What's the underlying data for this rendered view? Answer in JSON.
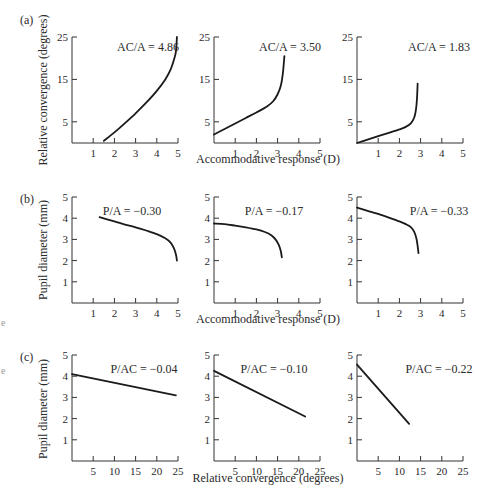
{
  "figure": {
    "rows": [
      {
        "panel_label": "(a)",
        "ylabel": "Relative convergence (degrees)",
        "xlabel": "Accommodative response (D)"
      },
      {
        "panel_label": "(b)",
        "ylabel": "Pupil diameter (mm)",
        "xlabel": "Accommodative response (D)"
      },
      {
        "panel_label": "(c)",
        "ylabel": "Pupil diameter (mm)",
        "xlabel": "Relative convergence (degrees)"
      }
    ],
    "stray_marks": [
      "e",
      "e"
    ]
  },
  "chart_data": [
    {
      "type": "line",
      "row": "a",
      "col": 1,
      "annotation": "AC/A = 4.86",
      "xlabel": "",
      "ylabel": "Relative convergence (degrees)",
      "xlim": [
        0,
        5
      ],
      "ylim": [
        0,
        25
      ],
      "xticks": [
        1,
        2,
        3,
        4,
        5
      ],
      "yticks": [
        5,
        15,
        25
      ],
      "x": [
        1.5,
        2.0,
        2.5,
        3.0,
        3.5,
        4.0,
        4.4,
        4.65,
        4.8,
        4.9,
        4.95
      ],
      "y": [
        0.5,
        2.5,
        4.7,
        7.0,
        9.5,
        12.3,
        15.0,
        17.3,
        19.5,
        21.5,
        25.0
      ]
    },
    {
      "type": "line",
      "row": "a",
      "col": 2,
      "annotation": "AC/A = 3.50",
      "xlabel": "Accommodative response (D)",
      "ylabel": "",
      "xlim": [
        0,
        5
      ],
      "ylim": [
        0,
        25
      ],
      "xticks": [
        1,
        2,
        3,
        4,
        5
      ],
      "yticks": [
        5,
        15,
        25
      ],
      "x": [
        0.0,
        0.5,
        1.0,
        1.5,
        2.0,
        2.5,
        2.8,
        3.0,
        3.15,
        3.25,
        3.32
      ],
      "y": [
        2.0,
        3.3,
        4.6,
        5.9,
        7.2,
        8.6,
        9.9,
        11.5,
        13.5,
        16.5,
        20.5
      ]
    },
    {
      "type": "line",
      "row": "a",
      "col": 3,
      "annotation": "AC/A = 1.83",
      "xlabel": "",
      "ylabel": "",
      "xlim": [
        0,
        5
      ],
      "ylim": [
        0,
        25
      ],
      "xticks": [
        1,
        2,
        3,
        4,
        5
      ],
      "yticks": [
        5,
        15,
        25
      ],
      "x": [
        0.0,
        0.5,
        1.0,
        1.5,
        2.0,
        2.3,
        2.55,
        2.7,
        2.78,
        2.83,
        2.86
      ],
      "y": [
        0.0,
        0.8,
        1.6,
        2.4,
        3.2,
        3.8,
        4.7,
        6.0,
        7.8,
        10.5,
        14.0
      ]
    },
    {
      "type": "line",
      "row": "b",
      "col": 1,
      "annotation": "P/A = −0.30",
      "xlabel": "",
      "ylabel": "Pupil diameter (mm)",
      "xlim": [
        0,
        5
      ],
      "ylim": [
        0,
        5
      ],
      "xticks": [
        1,
        2,
        3,
        4,
        5
      ],
      "yticks": [
        1,
        2,
        3,
        4,
        5
      ],
      "x": [
        1.3,
        2.0,
        2.5,
        3.0,
        3.5,
        4.0,
        4.4,
        4.65,
        4.8,
        4.9,
        4.95
      ],
      "y": [
        4.05,
        3.85,
        3.7,
        3.57,
        3.42,
        3.25,
        3.05,
        2.85,
        2.6,
        2.3,
        2.0
      ]
    },
    {
      "type": "line",
      "row": "b",
      "col": 2,
      "annotation": "P/A = −0.17",
      "xlabel": "Accommodative response (D)",
      "ylabel": "",
      "xlim": [
        0,
        5
      ],
      "ylim": [
        0,
        5
      ],
      "xticks": [
        1,
        2,
        3,
        4,
        5
      ],
      "yticks": [
        1,
        2,
        3,
        4,
        5
      ],
      "x": [
        0.0,
        0.5,
        1.0,
        1.5,
        2.0,
        2.4,
        2.7,
        2.9,
        3.05,
        3.15,
        3.2
      ],
      "y": [
        3.75,
        3.72,
        3.65,
        3.57,
        3.47,
        3.35,
        3.2,
        3.0,
        2.75,
        2.45,
        2.15
      ]
    },
    {
      "type": "line",
      "row": "b",
      "col": 3,
      "annotation": "P/A = −0.33",
      "xlabel": "",
      "ylabel": "",
      "xlim": [
        0,
        5
      ],
      "ylim": [
        0,
        5
      ],
      "xticks": [
        1,
        2,
        3,
        4,
        5
      ],
      "yticks": [
        1,
        2,
        3,
        4,
        5
      ],
      "x": [
        0.0,
        0.5,
        1.0,
        1.5,
        2.0,
        2.3,
        2.55,
        2.7,
        2.8,
        2.86,
        2.9
      ],
      "y": [
        4.5,
        4.35,
        4.2,
        4.03,
        3.85,
        3.72,
        3.57,
        3.35,
        3.05,
        2.7,
        2.35
      ]
    },
    {
      "type": "line",
      "row": "c",
      "col": 1,
      "annotation": "P/AC = −0.04",
      "xlabel": "",
      "ylabel": "Pupil diameter (mm)",
      "xlim": [
        0,
        25
      ],
      "ylim": [
        0,
        5
      ],
      "xticks": [
        5,
        10,
        15,
        20,
        25
      ],
      "yticks": [
        1,
        2,
        3,
        4,
        5
      ],
      "x": [
        0.0,
        24.5
      ],
      "y": [
        4.1,
        3.1
      ]
    },
    {
      "type": "line",
      "row": "c",
      "col": 2,
      "annotation": "P/AC = −0.10",
      "xlabel": "Relative convergence (degrees)",
      "ylabel": "",
      "xlim": [
        0,
        25
      ],
      "ylim": [
        0,
        5
      ],
      "xticks": [
        5,
        10,
        15,
        20,
        25
      ],
      "yticks": [
        1,
        2,
        3,
        4,
        5
      ],
      "x": [
        0.0,
        21.5
      ],
      "y": [
        4.25,
        2.1
      ]
    },
    {
      "type": "line",
      "row": "c",
      "col": 3,
      "annotation": "P/AC = −0.22",
      "xlabel": "",
      "ylabel": "",
      "xlim": [
        0,
        25
      ],
      "ylim": [
        0,
        5
      ],
      "xticks": [
        5,
        10,
        15,
        20,
        25
      ],
      "yticks": [
        1,
        2,
        3,
        4,
        5
      ],
      "x": [
        0.0,
        12.3
      ],
      "y": [
        4.55,
        1.75
      ]
    }
  ]
}
